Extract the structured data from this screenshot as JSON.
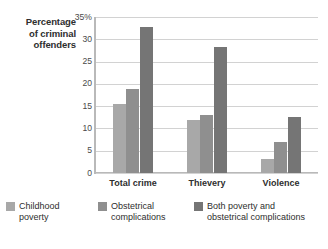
{
  "chart_data": {
    "type": "bar",
    "title": "",
    "xlabel": "",
    "ylabel": "Percentage of criminal offenders",
    "ylim": [
      0,
      35
    ],
    "yticks": [
      "0",
      "5",
      "10",
      "15",
      "20",
      "25",
      "30",
      "35%"
    ],
    "ytick_values": [
      0,
      5,
      10,
      15,
      20,
      25,
      30,
      35
    ],
    "grid": true,
    "legend_position": "bottom",
    "categories": [
      "Total crime",
      "Thievery",
      "Violence"
    ],
    "series": [
      {
        "name": "Childhood poverty",
        "color": "#a8a8a8",
        "values": [
          15.4,
          12.0,
          3.1
        ]
      },
      {
        "name": "Obstetrical complications",
        "color": "#8f8f8f",
        "values": [
          18.8,
          13.1,
          7.0
        ]
      },
      {
        "name": "Both poverty and obstetrical complications",
        "color": "#757575",
        "values": [
          32.8,
          28.2,
          12.5
        ]
      }
    ]
  },
  "axis": {
    "y_title_line1": "Percentage",
    "y_title_line2": "of criminal",
    "y_title_line3": "offenders",
    "y_title_full": "Percentage of criminal offenders"
  },
  "legend": {
    "items": [
      {
        "label": "Childhood\npoverty",
        "color": "#a8a8a8"
      },
      {
        "label": "Obstetrical\ncomplications",
        "color": "#8f8f8f"
      },
      {
        "label": "Both poverty and\nobstetrical complications",
        "color": "#757575"
      }
    ]
  }
}
